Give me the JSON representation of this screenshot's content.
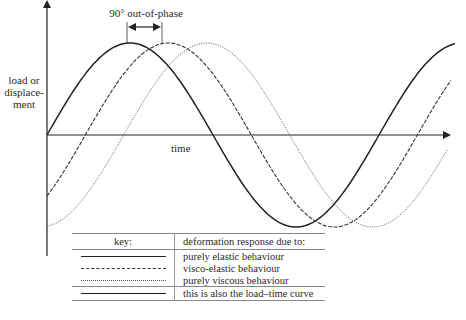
{
  "diagram": {
    "y_axis_label": "load or displace- ment",
    "x_axis_label": "time",
    "phase_annotation": "90° out-of-phase",
    "colors": {
      "ink": "#222222",
      "background": "#ffffff",
      "rule": "#888888"
    }
  },
  "key": {
    "header_key": "key:",
    "header_response": "deformation response due to:",
    "rows": [
      {
        "line_style": "solid",
        "label": "purely elastic behaviour"
      },
      {
        "line_style": "dashed",
        "label": "visco-elastic behaviour"
      },
      {
        "line_style": "dotted",
        "label": "purely viscous behaviour"
      },
      {
        "line_style": "solid",
        "label": "this is also the load–time curve"
      }
    ]
  },
  "chart_data": {
    "type": "line",
    "title": "",
    "xlabel": "time",
    "ylabel": "load or displacement",
    "grid": false,
    "series": [
      {
        "name": "purely elastic behaviour",
        "style": "solid",
        "phase_lag_deg": 0
      },
      {
        "name": "visco-elastic behaviour",
        "style": "dashed",
        "phase_lag_deg": 45
      },
      {
        "name": "purely viscous behaviour",
        "style": "dotted",
        "phase_lag_deg": 90
      }
    ],
    "annotations": [
      "90° out-of-phase"
    ]
  }
}
